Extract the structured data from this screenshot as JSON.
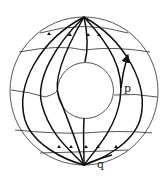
{
  "figure": {
    "labels": {
      "p": "p",
      "q": "q"
    },
    "colors": {
      "background": "#ffffff",
      "lines": "#111111"
    }
  }
}
